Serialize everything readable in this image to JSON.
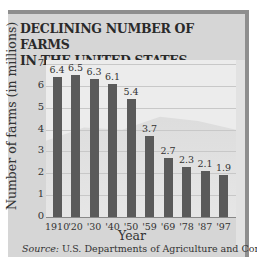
{
  "chart_data": {
    "type": "bar",
    "title": "DECLINING NUMBER OF FARMS IN THE UNITED STATES",
    "title_lines": [
      "DECLINING NUMBER OF FARMS",
      "IN THE UNITED STATES"
    ],
    "xlabel": "Year",
    "ylabel": "Number of farms (in millions)",
    "categories": [
      "1910",
      "'20",
      "'30",
      "'40",
      "'50",
      "'59",
      "'69",
      "'78",
      "'87",
      "'97"
    ],
    "values": [
      6.4,
      6.5,
      6.3,
      6.1,
      5.4,
      3.7,
      2.7,
      2.3,
      2.1,
      1.9
    ],
    "value_labels": [
      "6.4",
      "6.5",
      "6.3",
      "6.1",
      "5.4",
      "3.7",
      "2.7",
      "2.3",
      "2.1",
      "1.9"
    ],
    "yticks": [
      "0",
      "1",
      "2",
      "3",
      "4",
      "5",
      "6",
      "7"
    ],
    "ylim": [
      0,
      7
    ],
    "grid": true,
    "legend": null,
    "source_label": "Source:",
    "source_text": " U.S. Departments of Agriculture and Commerce",
    "bar_color": "#5a5a5a"
  }
}
